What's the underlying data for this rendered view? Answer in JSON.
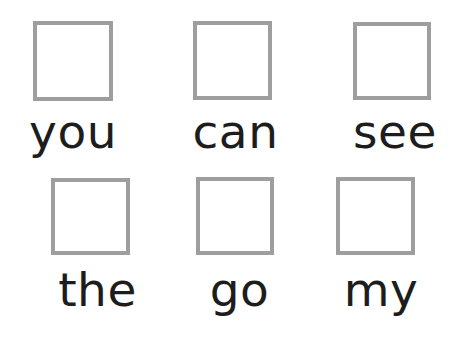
{
  "page": {
    "background_color": "#ffffff",
    "text_color": "#1d1d1d",
    "checkbox_border_color": "#9e9e9e",
    "checkbox_border_width": "4px",
    "checkbox_fill_color": "#ffffff"
  },
  "rows": [
    {
      "cells": [
        {
          "word": "you",
          "checked": false
        },
        {
          "word": "can",
          "checked": false
        },
        {
          "word": "see",
          "checked": false
        }
      ]
    },
    {
      "cells": [
        {
          "word": "the",
          "checked": false
        },
        {
          "word": "go",
          "checked": false
        },
        {
          "word": "my",
          "checked": false
        }
      ]
    }
  ]
}
